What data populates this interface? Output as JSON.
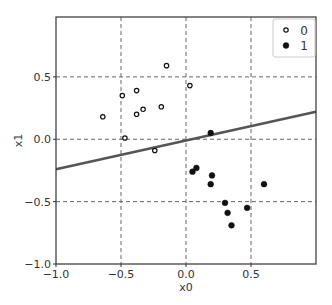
{
  "chart_data": {
    "type": "scatter",
    "title": "",
    "xlabel": "x0",
    "ylabel": "x1",
    "xlim": [
      -1.0,
      1.0
    ],
    "ylim": [
      -1.0,
      0.98
    ],
    "grid": true,
    "grid_style": "dashed",
    "legend_position": "upper right",
    "xticks": [
      -1.0,
      -0.5,
      0.0,
      0.5
    ],
    "xtick_labels": [
      "−1.0",
      "−0.5",
      "0.0",
      "0.5"
    ],
    "yticks": [
      -1.0,
      -0.5,
      0.0,
      0.5
    ],
    "ytick_labels": [
      "−1.0",
      "−0.5",
      "0.0",
      "0.5"
    ],
    "series": [
      {
        "name": "0",
        "marker": "open-circle",
        "points": [
          {
            "x": -0.64,
            "y": 0.18
          },
          {
            "x": -0.49,
            "y": 0.35
          },
          {
            "x": -0.38,
            "y": 0.39
          },
          {
            "x": -0.33,
            "y": 0.24
          },
          {
            "x": -0.38,
            "y": 0.2
          },
          {
            "x": -0.47,
            "y": 0.01
          },
          {
            "x": -0.15,
            "y": 0.59
          },
          {
            "x": 0.03,
            "y": 0.43
          },
          {
            "x": -0.19,
            "y": 0.26
          },
          {
            "x": -0.24,
            "y": -0.09
          }
        ]
      },
      {
        "name": "1",
        "marker": "filled-circle",
        "points": [
          {
            "x": 0.19,
            "y": 0.05
          },
          {
            "x": 0.05,
            "y": -0.26
          },
          {
            "x": 0.08,
            "y": -0.23
          },
          {
            "x": 0.2,
            "y": -0.29
          },
          {
            "x": 0.19,
            "y": -0.36
          },
          {
            "x": 0.6,
            "y": -0.36
          },
          {
            "x": 0.3,
            "y": -0.51
          },
          {
            "x": 0.32,
            "y": -0.59
          },
          {
            "x": 0.35,
            "y": -0.69
          },
          {
            "x": 0.47,
            "y": -0.55
          }
        ]
      }
    ],
    "decision_boundary": {
      "type": "line",
      "points": [
        {
          "x": -1.0,
          "y": -0.24
        },
        {
          "x": 1.0,
          "y": 0.22
        }
      ],
      "color": "#555555"
    },
    "legend": [
      {
        "label": "0",
        "marker": "open-circle"
      },
      {
        "label": "1",
        "marker": "filled-circle"
      }
    ]
  },
  "colors": {
    "axes": "#333333",
    "grid": "#555555",
    "marker": "#111111",
    "line": "#555555",
    "legend_border": "#cccccc"
  }
}
